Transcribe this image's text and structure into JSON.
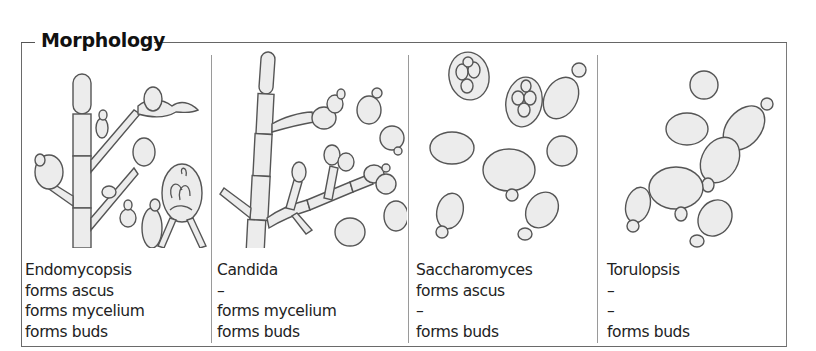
{
  "figure": {
    "title": "Morphology",
    "panels": [
      {
        "genus": "Endomycopsis",
        "ascus": "forms ascus",
        "mycelium": "forms mycelium",
        "buds": "forms buds",
        "illustration": "branched septate mycelium with budding cells and an ascus containing hat-shaped spores"
      },
      {
        "genus": "Candida",
        "ascus": "–",
        "mycelium": "forms mycelium",
        "buds": "forms buds",
        "illustration": "pseudomycelium with chains of elongated cells and blastospores"
      },
      {
        "genus": "Saccharomyces",
        "ascus": "forms ascus",
        "mycelium": "–",
        "buds": "forms buds",
        "illustration": "oval budding yeast cells and asci containing four ascospores"
      },
      {
        "genus": "Torulopsis",
        "ascus": "–",
        "mycelium": "–",
        "buds": "forms buds",
        "illustration": "round and oval budding yeast cells"
      }
    ]
  },
  "colors": {
    "cell_fill": "#ececec",
    "cell_stroke": "#555555",
    "frame": "#6a6a6a"
  }
}
